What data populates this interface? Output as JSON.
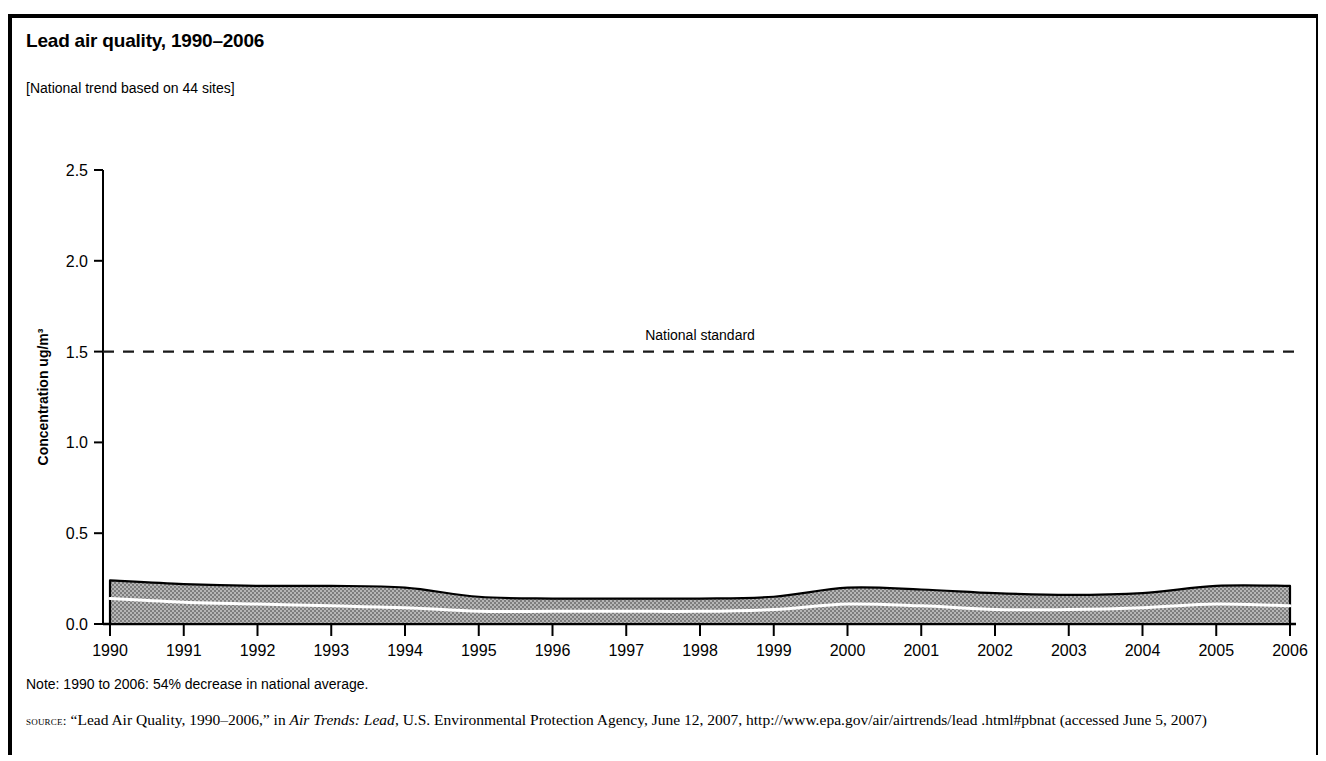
{
  "figure": {
    "title": "Lead air quality, 1990–2006",
    "subtitle": "[National trend based on 44 sites]",
    "note": "Note: 1990 to 2006: 54% decrease in national average.",
    "source_label": "source:",
    "source_text_1": " “Lead Air Quality, 1990–2006,” in ",
    "source_italic": "Air Trends: Lead",
    "source_text_2": ", U.S. Environmental Protection Agency, June 12, 2007, http://www.epa.gov/air/airtrends/lead .html#pbnat (accessed June 5, 2007)"
  },
  "colors": {
    "band_fill": "#9a9a9a",
    "band_outline": "#000000",
    "mean_line": "#ffffff",
    "axis": "#000000",
    "frame": "#000000"
  },
  "chart_data": {
    "type": "area",
    "title": "Lead air quality, 1990–2006",
    "subtitle": "[National trend based on 44 sites]",
    "xlabel": "",
    "ylabel": "Concentration ug/m³",
    "xlim": [
      1990,
      2006
    ],
    "ylim": [
      0.0,
      2.5
    ],
    "ytick_labels": [
      "0.0",
      "0.5",
      "1.0",
      "1.5",
      "2.0",
      "2.5"
    ],
    "ytick_values": [
      0.0,
      0.5,
      1.0,
      1.5,
      2.0,
      2.5
    ],
    "grid": false,
    "legend": "none",
    "x": [
      1990,
      1991,
      1992,
      1993,
      1994,
      1995,
      1996,
      1997,
      1998,
      1999,
      2000,
      2001,
      2002,
      2003,
      2004,
      2005,
      2006
    ],
    "xtick_labels": [
      "1990",
      "1991",
      "1992",
      "1993",
      "1994",
      "1995",
      "1996",
      "1997",
      "1998",
      "1999",
      "2000",
      "2001",
      "2002",
      "2003",
      "2004",
      "2005",
      "2006"
    ],
    "series": [
      {
        "name": "90th percentile (band upper bound)",
        "values": [
          0.24,
          0.22,
          0.21,
          0.21,
          0.2,
          0.15,
          0.14,
          0.14,
          0.14,
          0.15,
          0.2,
          0.19,
          0.17,
          0.16,
          0.17,
          0.21,
          0.21
        ]
      },
      {
        "name": "Band lower bound",
        "values": [
          0.0,
          0.0,
          0.0,
          0.0,
          0.0,
          0.0,
          0.0,
          0.0,
          0.0,
          0.0,
          0.0,
          0.0,
          0.0,
          0.0,
          0.0,
          0.0,
          0.0
        ]
      },
      {
        "name": "National average (mean line)",
        "values": [
          0.14,
          0.12,
          0.11,
          0.1,
          0.09,
          0.07,
          0.07,
          0.07,
          0.07,
          0.08,
          0.11,
          0.1,
          0.08,
          0.08,
          0.09,
          0.11,
          0.1
        ]
      }
    ],
    "annotations": [
      {
        "name": "national-standard",
        "label": "National standard",
        "value": 1.5,
        "style": "dashed-horizontal-line"
      }
    ]
  }
}
